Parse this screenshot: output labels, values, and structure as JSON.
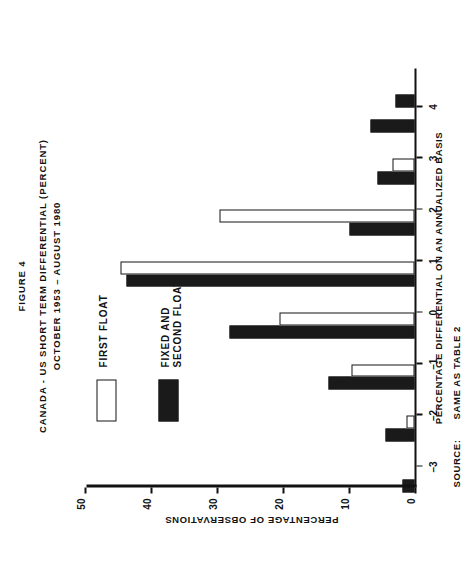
{
  "figure": {
    "number_label": "FIGURE 4",
    "title_line1": "CANADA - US SHORT TERM DIFFERENTIAL (PERCENT)",
    "title_line2": "OCTOBER 1953 – AUGUST 1980"
  },
  "legend": {
    "items": [
      {
        "label": "FIRST FLOAT",
        "swatch": "white",
        "color": "#ffffff"
      },
      {
        "label": "FIXED AND\nSECOND FLOAT",
        "label_line1": "FIXED AND",
        "label_line2": "SECOND FLOAT",
        "swatch": "black",
        "color": "#1a1a1a"
      }
    ]
  },
  "source": {
    "label": "SOURCE:",
    "text": "SAME AS TABLE 2"
  },
  "chart_data": {
    "type": "bar",
    "title": "CANADA - US SHORT TERM DIFFERENTIAL (PERCENT) OCTOBER 1953 – AUGUST 1980",
    "xlabel": "PERCENTAGE DIFFERENTIAL ON AN ANNUALIZED BASIS",
    "ylabel": "PERCENTAGE OF OBSERVATIONS",
    "xlim": [
      -3.4,
      4.75
    ],
    "ylim": [
      0,
      50
    ],
    "xticks": [
      -3,
      -2,
      -1,
      0,
      1,
      2,
      3,
      4
    ],
    "xticklabels": [
      "–3",
      "–2",
      "–1",
      "0",
      "1",
      "2",
      "3",
      "4"
    ],
    "yticks": [
      0,
      10,
      20,
      30,
      40,
      50
    ],
    "yticklabels": [
      "0",
      "10",
      "20",
      "30",
      "40",
      "50"
    ],
    "grid": false,
    "legend_position": "upper-right",
    "bin_width": 0.5,
    "categories": [
      "-3.5 to -3.0",
      "-3.0 to -2.5",
      "-2.5 to -2.0",
      "-2.0 to -1.5",
      "-1.5 to -1.0",
      "-1.0 to -0.5",
      "-0.5 to 0.0",
      "0.0 to 0.5",
      "0.5 to 1.0",
      "1.0 to 1.5",
      "1.5 to 2.0",
      "2.0 to 2.5",
      "2.5 to 3.0",
      "3.0 to 3.5",
      "3.5 to 4.0",
      "4.0 to 4.5"
    ],
    "bin_starts": [
      -3.5,
      -3.0,
      -2.5,
      -2.0,
      -1.5,
      -1.0,
      -0.5,
      0.0,
      0.5,
      1.0,
      1.5,
      2.0,
      2.5,
      3.0,
      3.5,
      4.0
    ],
    "series": [
      {
        "name": "FIRST FLOAT",
        "color": "#ffffff",
        "values": [
          0,
          0,
          1.2,
          0,
          9.6,
          0,
          20.5,
          0,
          44.6,
          0,
          29.5,
          0,
          3.3,
          0,
          0,
          0
        ]
      },
      {
        "name": "FIXED AND SECOND FLOAT",
        "color": "#1a1a1a",
        "values": [
          1.8,
          0,
          4.4,
          0,
          13.0,
          0,
          28.0,
          0,
          43.6,
          0,
          9.9,
          0,
          5.6,
          0,
          6.6,
          2.9
        ]
      }
    ]
  }
}
